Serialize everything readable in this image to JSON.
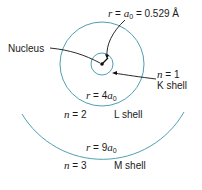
{
  "diagram": {
    "colors": {
      "shell": "#4f9fb3",
      "text": "#1a1a1a",
      "arrow": "#111111"
    },
    "nucleus": {
      "label": "Nucleus"
    },
    "bohr_radius": {
      "r_label": "r",
      "eq": "=",
      "a": "a",
      "sub": "0",
      "value": "= 0.529 Å"
    },
    "shells": [
      {
        "n_label": "n",
        "n_eq": "= 1",
        "name": "K shell",
        "r_text": ""
      },
      {
        "n_label": "n",
        "n_eq": "= 2",
        "name": "L shell",
        "r_label": "r",
        "r_eq": "= 4",
        "a": "a",
        "sub": "0"
      },
      {
        "n_label": "n",
        "n_eq": "= 3",
        "name": "M shell",
        "r_label": "r",
        "r_eq": "= 9",
        "a": "a",
        "sub": "0"
      }
    ]
  }
}
